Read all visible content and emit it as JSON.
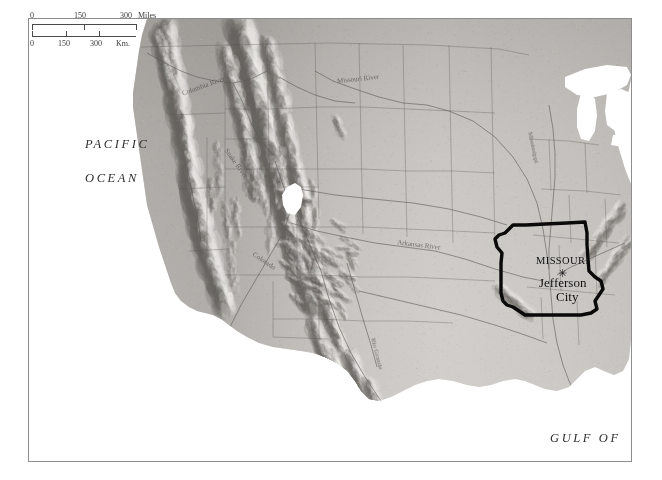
{
  "map": {
    "title": "United States shaded relief map with Missouri highlighted",
    "projection_note": "western and central United States",
    "colors": {
      "land_light": "#d8d6d2",
      "land_mid": "#b5b2ad",
      "land_dark": "#8a8783",
      "mountain_shadow": "#6e6b67",
      "water": "#ffffff",
      "frame": "#8d8d8d",
      "state_outline": "#0a0a0a",
      "label": "#2e2e2e",
      "river": "#6a6764"
    },
    "scale": {
      "miles": {
        "ticks": [
          "0",
          "150",
          "300"
        ],
        "unit": "Miles"
      },
      "km": {
        "ticks": [
          "0",
          "150",
          "300"
        ],
        "unit": "Km."
      }
    },
    "ocean_labels": [
      {
        "id": "pacific",
        "line1": "PACIFIC",
        "line2": "OCEAN"
      },
      {
        "id": "gulf",
        "line1": "GULF OF",
        "line2": "MEXICO"
      }
    ],
    "highlighted_state": {
      "name": "MISSOURI",
      "capital_marker": "✳",
      "capital_line1": "Jefferson",
      "capital_line2": "City"
    },
    "rivers": [
      {
        "name": "Columbia River",
        "label": "Columbia River"
      },
      {
        "name": "Missouri River",
        "label": "Missouri River"
      },
      {
        "name": "Mississippi River",
        "label": "Mississippi"
      },
      {
        "name": "Arkansas River",
        "label": "Arkansas River"
      },
      {
        "name": "Colorado River",
        "label": "Colorado"
      },
      {
        "name": "Rio Grande",
        "label": "Rio Grande"
      },
      {
        "name": "Snake River",
        "label": "Snake River"
      }
    ],
    "water_bodies": [
      {
        "name": "Great Salt Lake"
      },
      {
        "name": "Lake Superior"
      },
      {
        "name": "Lake Michigan"
      },
      {
        "name": "Lake Huron"
      },
      {
        "name": "Lake Erie"
      }
    ]
  }
}
